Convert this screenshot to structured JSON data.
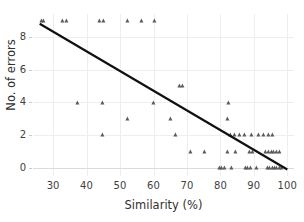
{
  "chart": {
    "title": "",
    "xaxis_title": "Similarity (%)",
    "yaxis_title": "No. of errors"
  },
  "chart_data": {
    "type": "scatter",
    "title": "",
    "xlabel": "Similarity (%)",
    "ylabel": "No. of errors",
    "xlim": [
      24,
      102
    ],
    "ylim": [
      -0.5,
      9.4
    ],
    "xticks": [
      30,
      40,
      50,
      60,
      70,
      80,
      90,
      100
    ],
    "yticks": [
      0,
      2,
      4,
      6,
      8
    ],
    "xtick_labels": [
      "30",
      "40",
      "50",
      "60",
      "70",
      "80",
      "90",
      "100"
    ],
    "ytick_labels": [
      "0",
      "2",
      "4",
      "6",
      "8"
    ],
    "grid": true,
    "legend": false,
    "marker": "triangle",
    "marker_color": "#5a5a5a",
    "line_color": "#111111",
    "points": [
      [
        26.6,
        9
      ],
      [
        27.4,
        9
      ],
      [
        32.9,
        9
      ],
      [
        34.2,
        9
      ],
      [
        44.1,
        9
      ],
      [
        45.3,
        9
      ],
      [
        52.3,
        9
      ],
      [
        56.6,
        9
      ],
      [
        60.5,
        9
      ],
      [
        68.0,
        5
      ],
      [
        68.9,
        5
      ],
      [
        37.3,
        4
      ],
      [
        44.8,
        4
      ],
      [
        60.2,
        4
      ],
      [
        82.6,
        4
      ],
      [
        52.4,
        3
      ],
      [
        65.2,
        3
      ],
      [
        82.4,
        3
      ],
      [
        45.0,
        2
      ],
      [
        66.8,
        2
      ],
      [
        83.1,
        2
      ],
      [
        84.4,
        2
      ],
      [
        85.9,
        2
      ],
      [
        87.2,
        2
      ],
      [
        89.3,
        2
      ],
      [
        91.5,
        2
      ],
      [
        93.0,
        2
      ],
      [
        94.4,
        2
      ],
      [
        95.8,
        2
      ],
      [
        71.2,
        1
      ],
      [
        75.4,
        1
      ],
      [
        82.3,
        1
      ],
      [
        84.6,
        1
      ],
      [
        88.7,
        1
      ],
      [
        89.6,
        1
      ],
      [
        93.6,
        1
      ],
      [
        94.5,
        1
      ],
      [
        95.3,
        1
      ],
      [
        96.1,
        1
      ],
      [
        96.9,
        1
      ],
      [
        97.7,
        1
      ],
      [
        79.9,
        0
      ],
      [
        80.6,
        0
      ],
      [
        81.3,
        0
      ],
      [
        83.4,
        0
      ],
      [
        87.6,
        0
      ],
      [
        88.3,
        0
      ],
      [
        89.0,
        0
      ],
      [
        90.9,
        0
      ],
      [
        94.2,
        0
      ],
      [
        94.9,
        0
      ],
      [
        95.6,
        0
      ],
      [
        96.3,
        0
      ],
      [
        97.0,
        0
      ],
      [
        97.7,
        0
      ],
      [
        98.4,
        0
      ]
    ],
    "trendline": {
      "x_start": 26.0,
      "y_start": 8.8,
      "x_end": 100.0,
      "y_end": -0.1
    }
  }
}
